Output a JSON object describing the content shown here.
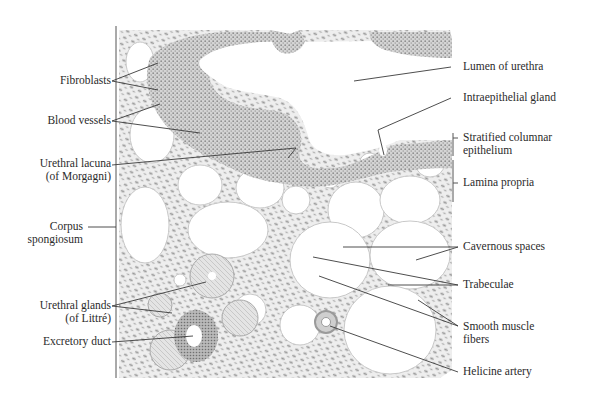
{
  "figure": {
    "type": "histology-illustration"
  },
  "labels_left": [
    {
      "id": "fibroblasts",
      "lines": [
        "Fibroblasts"
      ]
    },
    {
      "id": "blood-vessels",
      "lines": [
        "Blood vessels"
      ]
    },
    {
      "id": "urethral-lacuna",
      "lines": [
        "Urethral lacuna",
        "(of Morgagni)"
      ]
    },
    {
      "id": "corpus-spongiosum",
      "lines": [
        "Corpus",
        "spongiosum"
      ]
    },
    {
      "id": "urethral-glands",
      "lines": [
        "Urethral glands",
        "(of Littré)"
      ]
    },
    {
      "id": "excretory-duct",
      "lines": [
        "Excretory duct"
      ]
    }
  ],
  "labels_right": [
    {
      "id": "lumen-of-urethra",
      "lines": [
        "Lumen of urethra"
      ]
    },
    {
      "id": "intraepithelial-gland",
      "lines": [
        "Intraepithelial gland"
      ]
    },
    {
      "id": "stratified-columnar-epithelium",
      "lines": [
        "Stratified columnar",
        "epithelium"
      ]
    },
    {
      "id": "lamina-propria",
      "lines": [
        "Lamina propria"
      ]
    },
    {
      "id": "cavernous-spaces",
      "lines": [
        "Cavernous spaces"
      ]
    },
    {
      "id": "trabeculae",
      "lines": [
        "Trabeculae"
      ]
    },
    {
      "id": "smooth-muscle-fibers",
      "lines": [
        "Smooth muscle",
        "fibers"
      ]
    },
    {
      "id": "helicine-artery",
      "lines": [
        "Helicine artery"
      ]
    }
  ],
  "colors": {
    "text": "#2b2b2b",
    "leader_line": "#3a3a3a",
    "tissue_fill": "#ececec",
    "epithelium_fill": "#c9c9c9",
    "nuclei": "#8c8c8c"
  }
}
